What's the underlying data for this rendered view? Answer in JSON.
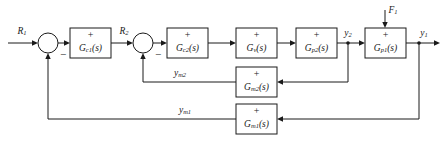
{
  "diagram": {
    "type": "control-block-diagram",
    "colors": {
      "line": "#1a1a1a",
      "block_fill": "#ffffff",
      "background": "#ffffff"
    },
    "blocks": [
      {
        "id": "gc1",
        "label_main": "G",
        "label_sub": "c1",
        "label_tail": "(s)",
        "sign": "+",
        "x": 70,
        "y": 28,
        "w": 41,
        "h": 30
      },
      {
        "id": "gc2",
        "label_main": "G",
        "label_sub": "c2",
        "label_tail": "(s)",
        "sign": "+",
        "x": 167,
        "y": 28,
        "w": 41,
        "h": 30
      },
      {
        "id": "gv",
        "label_main": "G",
        "label_sub": "v",
        "label_tail": "(s)",
        "sign": "+",
        "x": 236,
        "y": 28,
        "w": 41,
        "h": 30
      },
      {
        "id": "gp2",
        "label_main": "G",
        "label_sub": "p2",
        "label_tail": "(s)",
        "sign": "+",
        "x": 296,
        "y": 28,
        "w": 41,
        "h": 30
      },
      {
        "id": "gp1",
        "label_main": "G",
        "label_sub": "p1",
        "label_tail": "(s)",
        "sign": "+",
        "x": 365,
        "y": 28,
        "w": 41,
        "h": 30
      },
      {
        "id": "gm2",
        "label_main": "G",
        "label_sub": "m2",
        "label_tail": "(s)",
        "sign": "+",
        "x": 236,
        "y": 67,
        "w": 41,
        "h": 30
      },
      {
        "id": "gm1",
        "label_main": "G",
        "label_sub": "m1",
        "label_tail": "(s)",
        "sign": "+",
        "x": 236,
        "y": 104,
        "w": 41,
        "h": 30
      }
    ],
    "summing_junctions": [
      {
        "id": "sum1",
        "cx": 48,
        "cy": 43,
        "r": 10,
        "minus": "−"
      },
      {
        "id": "sum2",
        "cx": 143,
        "cy": 43,
        "r": 10,
        "minus": "−"
      }
    ],
    "signals": [
      {
        "id": "r1",
        "main": "R",
        "sub": "1",
        "x": 22,
        "y": 32
      },
      {
        "id": "r2",
        "main": "R",
        "sub": "2",
        "x": 124,
        "y": 32
      },
      {
        "id": "y2",
        "main": "y",
        "sub": "2",
        "x": 348,
        "y": 34
      },
      {
        "id": "y1",
        "main": "y",
        "sub": "1",
        "x": 422,
        "y": 34
      },
      {
        "id": "f1",
        "main": "F",
        "sub": "1",
        "x": 392,
        "y": 11
      },
      {
        "id": "ym2",
        "main": "y",
        "sub": "m2",
        "x": 180,
        "y": 74
      },
      {
        "id": "ym1",
        "main": "y",
        "sub": "m1",
        "x": 185,
        "y": 111
      }
    ]
  }
}
